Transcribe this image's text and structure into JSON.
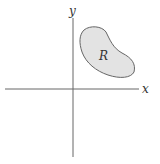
{
  "diagram": {
    "axes": {
      "x_label": "x",
      "y_label": "y"
    },
    "region": {
      "label": "R",
      "fill": "#e3e3e3",
      "stroke": "#666666"
    },
    "axis_color": "#555555"
  }
}
